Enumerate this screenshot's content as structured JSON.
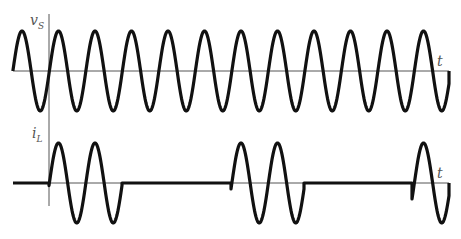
{
  "diagram": {
    "title": "",
    "colors": {
      "wave": "#111111",
      "axis": "#555555",
      "label": "#555555",
      "background": "#ffffff"
    },
    "top_plot": {
      "signal_label": "v",
      "signal_subscript": "S",
      "time_label": "t",
      "description": "Continuous sinusoidal source voltage",
      "baseline_y": 71,
      "amplitude_px": 40,
      "period_px": 36.5,
      "first_peak_x": 22,
      "x_start": 13,
      "x_end": 449
    },
    "bottom_plot": {
      "signal_label": "i",
      "signal_subscript": "L",
      "time_label": "t",
      "description": "Load current in bursts of two cycles, zero otherwise",
      "baseline_y": 183,
      "amplitude_px": 40,
      "period_px": 36.5,
      "first_peak_x": 22,
      "x_start": 13,
      "x_end": 449,
      "bursts": [
        {
          "start_x": 49,
          "end_x": 122,
          "cycles": 2
        },
        {
          "start_x": 231,
          "end_x": 304,
          "cycles": 2
        },
        {
          "start_x": 412,
          "end_x": 449,
          "cycles": 1
        }
      ]
    },
    "vertical_axis": {
      "x": 49,
      "y_top": 14,
      "y_bottom": 206
    }
  }
}
